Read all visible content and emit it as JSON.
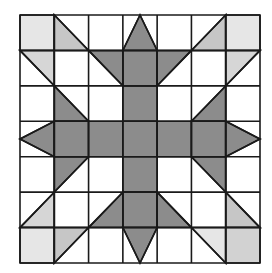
{
  "quilt": {
    "rows": 7,
    "cols": 7,
    "origin": {
      "x": 20,
      "y": 15
    },
    "size": {
      "width": 240,
      "height": 248
    },
    "colors": {
      "dark": "#8c8c8c",
      "light": "#e6e6e6",
      "medium_light": "#c6c6c6",
      "light_mid": "#d6d6d6",
      "corner_br": "#d2d2d2",
      "background": "#ffffff",
      "line": "#1a1a1a"
    },
    "shapes": [
      {
        "row": 0,
        "col": 0,
        "fill": "light",
        "pts": [
          "TL",
          "TR",
          "BR",
          "BL"
        ]
      },
      {
        "row": 0,
        "col": 1,
        "fill": "medium_light",
        "pts": [
          "TL",
          "BL",
          "BR"
        ]
      },
      {
        "row": 0,
        "col": 3,
        "fill": "dark",
        "pts": [
          "TM",
          "BR",
          "BL"
        ]
      },
      {
        "row": 0,
        "col": 5,
        "fill": "medium_light",
        "pts": [
          "TR",
          "BR",
          "BL"
        ]
      },
      {
        "row": 0,
        "col": 6,
        "fill": "light",
        "pts": [
          "TL",
          "TR",
          "BR",
          "BL"
        ]
      },
      {
        "row": 1,
        "col": 0,
        "fill": "light_mid",
        "pts": [
          "TL",
          "TR",
          "BR"
        ]
      },
      {
        "row": 1,
        "col": 2,
        "fill": "dark",
        "pts": [
          "TL",
          "TR",
          "BR"
        ]
      },
      {
        "row": 1,
        "col": 3,
        "fill": "dark",
        "pts": [
          "TL",
          "TR",
          "BR",
          "BL"
        ]
      },
      {
        "row": 1,
        "col": 4,
        "fill": "dark",
        "pts": [
          "TL",
          "TR",
          "BL"
        ]
      },
      {
        "row": 1,
        "col": 6,
        "fill": "light_mid",
        "pts": [
          "TL",
          "TR",
          "BL"
        ]
      },
      {
        "row": 2,
        "col": 1,
        "fill": "dark",
        "pts": [
          "TL",
          "BR",
          "BL"
        ]
      },
      {
        "row": 2,
        "col": 3,
        "fill": "dark",
        "pts": [
          "TL",
          "TR",
          "BR",
          "BL"
        ]
      },
      {
        "row": 2,
        "col": 5,
        "fill": "dark",
        "pts": [
          "TR",
          "BR",
          "BL"
        ]
      },
      {
        "row": 3,
        "col": 0,
        "fill": "dark",
        "pts": [
          "LM",
          "TR",
          "BR"
        ]
      },
      {
        "row": 3,
        "col": 1,
        "fill": "dark",
        "pts": [
          "TL",
          "TR",
          "BR",
          "BL"
        ]
      },
      {
        "row": 3,
        "col": 2,
        "fill": "dark",
        "pts": [
          "TL",
          "TR",
          "BR",
          "BL"
        ]
      },
      {
        "row": 3,
        "col": 3,
        "fill": "dark",
        "pts": [
          "TL",
          "TR",
          "BR",
          "BL"
        ]
      },
      {
        "row": 3,
        "col": 4,
        "fill": "dark",
        "pts": [
          "TL",
          "TR",
          "BR",
          "BL"
        ]
      },
      {
        "row": 3,
        "col": 5,
        "fill": "dark",
        "pts": [
          "TL",
          "TR",
          "BR",
          "BL"
        ]
      },
      {
        "row": 3,
        "col": 6,
        "fill": "dark",
        "pts": [
          "TL",
          "RM",
          "BL"
        ]
      },
      {
        "row": 4,
        "col": 1,
        "fill": "dark",
        "pts": [
          "TL",
          "TR",
          "BL"
        ]
      },
      {
        "row": 4,
        "col": 3,
        "fill": "dark",
        "pts": [
          "TL",
          "TR",
          "BR",
          "BL"
        ]
      },
      {
        "row": 4,
        "col": 5,
        "fill": "dark",
        "pts": [
          "TL",
          "TR",
          "BR"
        ]
      },
      {
        "row": 5,
        "col": 0,
        "fill": "light_mid",
        "pts": [
          "TR",
          "BR",
          "BL"
        ]
      },
      {
        "row": 5,
        "col": 2,
        "fill": "dark",
        "pts": [
          "TR",
          "BR",
          "BL"
        ]
      },
      {
        "row": 5,
        "col": 3,
        "fill": "dark",
        "pts": [
          "TL",
          "TR",
          "BR",
          "BL"
        ]
      },
      {
        "row": 5,
        "col": 4,
        "fill": "dark",
        "pts": [
          "TL",
          "BR",
          "BL"
        ]
      },
      {
        "row": 5,
        "col": 6,
        "fill": "medium_light",
        "pts": [
          "TL",
          "BR",
          "BL"
        ]
      },
      {
        "row": 6,
        "col": 0,
        "fill": "light",
        "pts": [
          "TL",
          "TR",
          "BR",
          "BL"
        ]
      },
      {
        "row": 6,
        "col": 1,
        "fill": "medium_light",
        "pts": [
          "TL",
          "TR",
          "BL"
        ]
      },
      {
        "row": 6,
        "col": 3,
        "fill": "dark",
        "pts": [
          "TL",
          "TR",
          "BM"
        ]
      },
      {
        "row": 6,
        "col": 5,
        "fill": "light",
        "pts": [
          "TL",
          "TR",
          "BR"
        ]
      },
      {
        "row": 6,
        "col": 6,
        "fill": "corner_br",
        "pts": [
          "TL",
          "TR",
          "BR",
          "BL"
        ]
      }
    ]
  }
}
